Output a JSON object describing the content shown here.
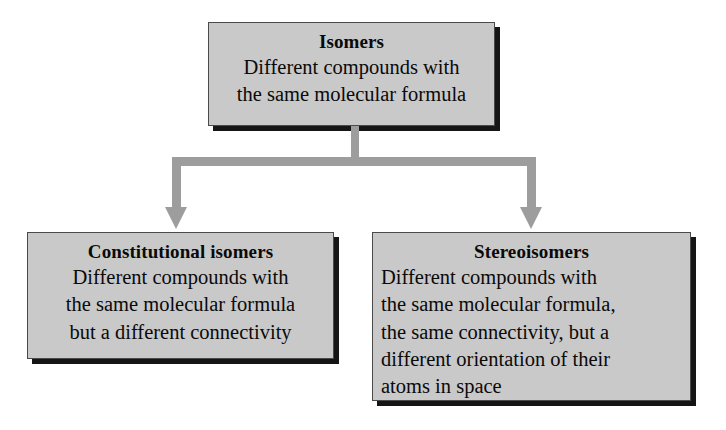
{
  "diagram": {
    "colors": {
      "box_fill": "#c9c9c9",
      "box_border": "#4a4a4a",
      "box_shadow": "#151515",
      "connector": "#9d9d9d",
      "text": "#0a0a0a",
      "background": "#ffffff"
    },
    "nodes": {
      "root": {
        "title": "Isomers",
        "body": "Different compounds with\nthe same molecular formula",
        "align": "centered"
      },
      "left": {
        "title": "Constitutional isomers",
        "body": "Different compounds with\nthe same molecular formula\nbut a different connectivity",
        "align": "centered"
      },
      "right": {
        "title": "Stereoisomers",
        "body": "Different compounds with\nthe same molecular formula,\nthe same connectivity, but a\ndifferent orientation of their\natoms in space",
        "align": "left"
      }
    },
    "connectors": [
      {
        "from": "root",
        "to": "left",
        "style": "elbow-arrow"
      },
      {
        "from": "root",
        "to": "right",
        "style": "elbow-arrow"
      }
    ]
  }
}
